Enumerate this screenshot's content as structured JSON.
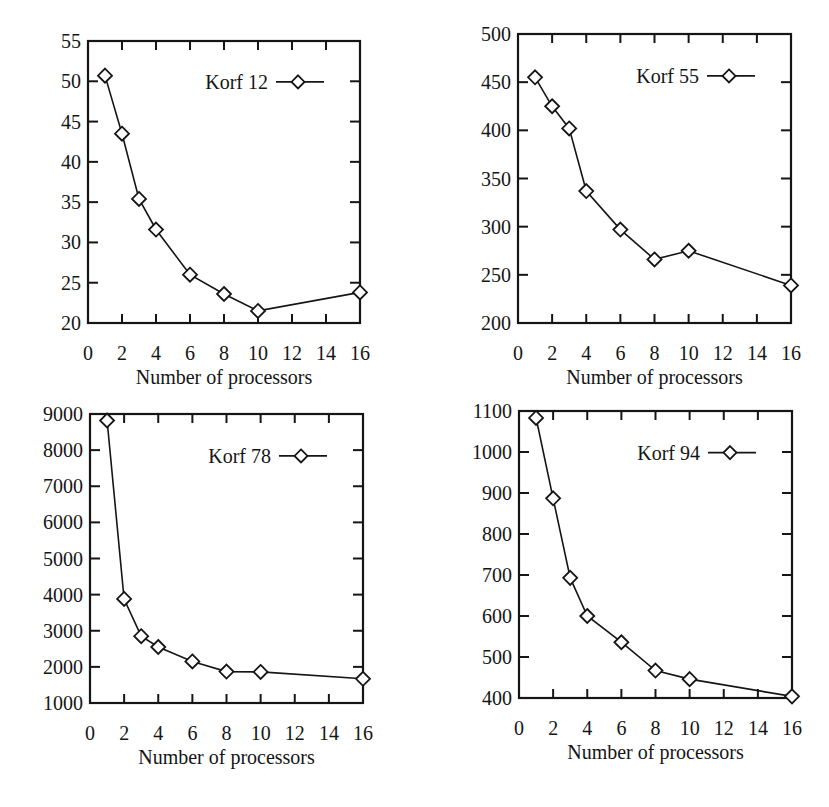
{
  "figure": {
    "background": "#ffffff",
    "ink_color": "#151515"
  },
  "chart_data": [
    {
      "type": "line",
      "title": "",
      "legend": "Korf 12",
      "legend_position": "top-right",
      "marker": "diamond",
      "xlabel": "Number of processors",
      "ylabel": "",
      "x_ticks": [
        0,
        2,
        4,
        6,
        8,
        10,
        12,
        14,
        16
      ],
      "y_ticks": [
        20,
        25,
        30,
        35,
        40,
        45,
        50,
        55
      ],
      "xlim": [
        0,
        16
      ],
      "ylim": [
        20,
        55
      ],
      "grid": false,
      "x": [
        1,
        2,
        3,
        4,
        6,
        8,
        10,
        16
      ],
      "series": [
        {
          "name": "Korf 12",
          "values": [
            50.7,
            43.5,
            35.4,
            31.6,
            26.0,
            23.6,
            21.5,
            23.8
          ]
        }
      ],
      "frame": {
        "left": 88,
        "top": 41,
        "right": 360,
        "bottom": 323
      }
    },
    {
      "type": "line",
      "title": "",
      "legend": "Korf 55",
      "legend_position": "top-right",
      "marker": "diamond",
      "xlabel": "Number of processors",
      "ylabel": "",
      "x_ticks": [
        0,
        2,
        4,
        6,
        8,
        10,
        12,
        14,
        16
      ],
      "y_ticks": [
        200,
        250,
        300,
        350,
        400,
        450,
        500
      ],
      "xlim": [
        0,
        16
      ],
      "ylim": [
        200,
        500
      ],
      "grid": false,
      "x": [
        1,
        2,
        3,
        4,
        6,
        8,
        10,
        16
      ],
      "series": [
        {
          "name": "Korf 55",
          "values": [
            455,
            425,
            402,
            337,
            297,
            266,
            275,
            239
          ]
        }
      ],
      "frame": {
        "left": 518,
        "top": 34,
        "right": 791,
        "bottom": 323
      }
    },
    {
      "type": "line",
      "title": "",
      "legend": "Korf 78",
      "legend_position": "top-right",
      "marker": "diamond",
      "xlabel": "Number of processors",
      "ylabel": "",
      "x_ticks": [
        0,
        2,
        4,
        6,
        8,
        10,
        12,
        14,
        16
      ],
      "y_ticks": [
        1000,
        2000,
        3000,
        4000,
        5000,
        6000,
        7000,
        8000,
        9000
      ],
      "xlim": [
        0,
        16
      ],
      "ylim": [
        1000,
        9000
      ],
      "grid": false,
      "x": [
        1,
        2,
        3,
        4,
        6,
        8,
        10,
        16
      ],
      "series": [
        {
          "name": "Korf 78",
          "values": [
            8820,
            3880,
            2850,
            2550,
            2150,
            1870,
            1860,
            1670
          ]
        }
      ],
      "frame": {
        "left": 90,
        "top": 414,
        "right": 363,
        "bottom": 703
      }
    },
    {
      "type": "line",
      "title": "",
      "legend": "Korf 94",
      "legend_position": "top-right",
      "marker": "diamond",
      "xlabel": "Number of processors",
      "ylabel": "",
      "x_ticks": [
        0,
        2,
        4,
        6,
        8,
        10,
        12,
        14,
        16
      ],
      "y_ticks": [
        400,
        500,
        600,
        700,
        800,
        900,
        1000,
        1100
      ],
      "xlim": [
        0,
        16
      ],
      "ylim": [
        400,
        1100
      ],
      "grid": false,
      "x": [
        1,
        2,
        3,
        4,
        6,
        8,
        10,
        16
      ],
      "series": [
        {
          "name": "Korf 94",
          "values": [
            1083,
            887,
            693,
            600,
            536,
            467,
            446,
            404
          ]
        }
      ],
      "frame": {
        "left": 519,
        "top": 411,
        "right": 792,
        "bottom": 698
      }
    }
  ]
}
